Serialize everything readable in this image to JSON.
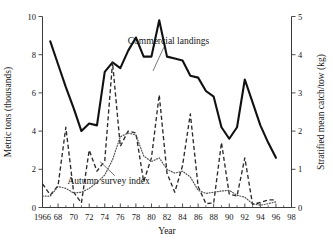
{
  "chart_data": {
    "type": "line",
    "title": "",
    "xlabel": "Year",
    "ylabel": "Metric tons (thousands)",
    "ylabel_right": "Stratified mean catch/tow (kg)",
    "xlim": [
      1966,
      1998
    ],
    "ylim": [
      0,
      10
    ],
    "ylim_right": [
      0,
      5
    ],
    "grid": false,
    "legend": "annotations-inline",
    "xticks": [
      1966,
      1968,
      1970,
      1972,
      1974,
      1976,
      1978,
      1980,
      1982,
      1984,
      1986,
      1988,
      1990,
      1992,
      1994,
      1996,
      1998
    ],
    "xticklabels": [
      "1966",
      "68",
      "70",
      "72",
      "74",
      "76",
      "78",
      "80",
      "82",
      "84",
      "86",
      "88",
      "90",
      "92",
      "94",
      "96",
      "98"
    ],
    "yticks": [
      0,
      2,
      4,
      6,
      8,
      10
    ],
    "yticklabels": [
      "0",
      "2",
      "4",
      "6",
      "8",
      "10"
    ],
    "yticks_right": [
      0,
      1,
      2,
      3,
      4,
      5
    ],
    "yticklabels_right": [
      "0",
      "1",
      "2",
      "3",
      "4",
      "5"
    ],
    "annotations": [
      {
        "text": "Commercial landings",
        "x": 1982.2,
        "y": 8.55
      },
      {
        "text": "Autumn survey index",
        "x": 1974.5,
        "y": 0.62
      }
    ],
    "series": [
      {
        "name": "Commercial landings",
        "style": "solid",
        "axis": "left",
        "units": "metric tons (thousands)",
        "x": [
          1967,
          1968,
          1969,
          1970,
          1971,
          1972,
          1973,
          1974,
          1975,
          1976,
          1977,
          1978,
          1979,
          1980,
          1981,
          1982,
          1983,
          1984,
          1985,
          1986,
          1987,
          1988,
          1989,
          1990,
          1991,
          1992,
          1993,
          1994,
          1995,
          1996
        ],
        "values": [
          8.7,
          7.5,
          6.3,
          5.2,
          4.0,
          4.4,
          4.3,
          7.1,
          7.6,
          7.3,
          8.2,
          8.9,
          7.9,
          7.9,
          9.8,
          7.9,
          7.8,
          7.7,
          6.9,
          6.8,
          6.1,
          5.8,
          4.2,
          3.6,
          4.2,
          6.7,
          5.5,
          4.3,
          3.4,
          2.6
        ]
      },
      {
        "name": "Autumn survey index",
        "style": "dashed",
        "axis": "right",
        "units": "kg/tow",
        "x": [
          1966,
          1967,
          1968,
          1969,
          1970,
          1971,
          1972,
          1973,
          1974,
          1975,
          1976,
          1977,
          1978,
          1979,
          1980,
          1981,
          1982,
          1983,
          1984,
          1985,
          1986,
          1987,
          1988,
          1989,
          1990,
          1991,
          1992,
          1993,
          1994,
          1995,
          1996
        ],
        "values": [
          0.62,
          0.33,
          0.57,
          2.1,
          0.4,
          0.12,
          1.5,
          0.95,
          1.22,
          3.8,
          1.6,
          2.0,
          1.95,
          0.68,
          1.3,
          2.95,
          0.9,
          0.4,
          1.1,
          2.45,
          0.55,
          0.1,
          0.12,
          1.7,
          0.35,
          0.3,
          1.3,
          0.08,
          0.13,
          0.2,
          0.2
        ]
      },
      {
        "name": "Recruitment index",
        "style": "dotted",
        "axis": "right",
        "units": "kg/tow",
        "x": [
          1966,
          1967,
          1968,
          1969,
          1970,
          1971,
          1972,
          1973,
          1974,
          1975,
          1976,
          1977,
          1978,
          1979,
          1980,
          1981,
          1982,
          1983,
          1984,
          1985,
          1986,
          1987,
          1988,
          1989,
          1990,
          1991,
          1992,
          1993,
          1994,
          1995,
          1996
        ],
        "values": [
          0.3,
          0.3,
          0.55,
          0.5,
          0.38,
          0.4,
          0.5,
          0.65,
          0.85,
          1.25,
          1.85,
          1.95,
          1.9,
          1.35,
          1.2,
          1.3,
          1.0,
          0.9,
          0.95,
          0.8,
          0.45,
          0.37,
          0.4,
          0.43,
          0.45,
          0.32,
          0.27,
          0.1,
          0.06,
          0.1,
          0.15
        ]
      }
    ]
  }
}
